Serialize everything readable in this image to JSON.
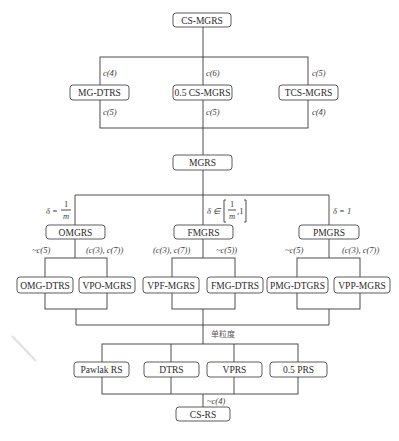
{
  "diagram": {
    "root": {
      "label": "CS-MGRS"
    },
    "level1": [
      {
        "label": "MG-DTRS",
        "upper": "c(4)",
        "lower": "c(5)"
      },
      {
        "label": "0.5 CS-MGRS",
        "upper": "c(6)",
        "lower": "c(5)"
      },
      {
        "label": "TCS-MGRS",
        "upper": "c(5)",
        "lower": "c(4)"
      }
    ],
    "mgrs": {
      "label": "MGRS"
    },
    "level2": [
      {
        "label": "OMGRS",
        "condition": "δ = 1/m",
        "condition_parts": {
          "lhs": "δ =",
          "num": "1",
          "den": "m"
        }
      },
      {
        "label": "FMGRS",
        "condition": "δ ∈ [1/m, 1]",
        "condition_parts": {
          "lhs": "δ ∈",
          "num": "1",
          "den": "m",
          "tail": ",1"
        }
      },
      {
        "label": "PMGRS",
        "condition": "δ = 1"
      }
    ],
    "level2_annotations": [
      {
        "left": "~c(5)",
        "right": "(c(3), c(7))"
      },
      {
        "left": "(c(3), c(7))",
        "right": "~c(5))"
      },
      {
        "left": "~c(5)",
        "right": "(c(3), c(7))"
      }
    ],
    "level3": [
      {
        "label": "OMG-DTRS"
      },
      {
        "label": "VPO-MGRS"
      },
      {
        "label": "VPF-MGRS"
      },
      {
        "label": "FMG-DTRS"
      },
      {
        "label": "PMG-DTGRS"
      },
      {
        "label": "VPP-MGRS"
      }
    ],
    "single_granularity_label": "单粒度",
    "level4": [
      {
        "label": "Pawlak RS"
      },
      {
        "label": "DTRS"
      },
      {
        "label": "VPRS"
      },
      {
        "label": "0.5 PRS"
      }
    ],
    "bottom_annotation": "~c(4)",
    "leaf": {
      "label": "CS-RS"
    }
  }
}
